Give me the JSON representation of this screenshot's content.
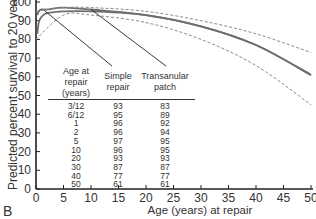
{
  "panel_label": "B",
  "chart_data": {
    "type": "line",
    "title": "",
    "xlabel": "Age (years) at repair",
    "ylabel": "Predicted percent survival to 20 years",
    "xlim": [
      0,
      50
    ],
    "ylim": [
      0,
      100
    ],
    "xticks": [
      "0",
      "5",
      "10",
      "15",
      "20",
      "25",
      "30",
      "35",
      "40",
      "45",
      "50"
    ],
    "yticks": [
      "0",
      "10",
      "20",
      "30",
      "40",
      "50",
      "60",
      "70",
      "80",
      "90",
      "100"
    ],
    "grid": false,
    "series": [
      {
        "name": "Simple repair",
        "style": "solid",
        "x": [
          0.25,
          0.5,
          1,
          2,
          5,
          10,
          20,
          30,
          40,
          50
        ],
        "values": [
          93,
          95,
          96,
          96,
          97,
          96,
          93,
          87,
          77,
          61
        ]
      },
      {
        "name": "Transanular patch",
        "style": "solid",
        "x": [
          0.25,
          0.5,
          1,
          2,
          5,
          10,
          20,
          30,
          40,
          50
        ],
        "values": [
          83,
          89,
          92,
          94,
          95,
          95,
          93,
          87,
          77,
          61
        ]
      },
      {
        "name": "Upper confidence limit",
        "style": "dashed",
        "x": [
          0,
          5,
          10,
          20,
          30,
          40,
          50
        ],
        "values": [
          95,
          97,
          97,
          95,
          90,
          83,
          73
        ]
      },
      {
        "name": "Lower confidence limit",
        "style": "dashed",
        "x": [
          0,
          5,
          10,
          20,
          30,
          40,
          50
        ],
        "values": [
          80,
          93,
          93,
          89,
          80,
          66,
          45
        ]
      }
    ],
    "annotations": [
      "Simple repair",
      "Transanular patch"
    ],
    "table": {
      "headers": [
        "Age at repair (years)",
        "Simple repair",
        "Transanular patch"
      ],
      "rows": [
        [
          "3/12",
          "93",
          "83"
        ],
        [
          "6/12",
          "95",
          "89"
        ],
        [
          "1",
          "96",
          "92"
        ],
        [
          "2",
          "96",
          "94"
        ],
        [
          "5",
          "97",
          "95"
        ],
        [
          "10",
          "96",
          "95"
        ],
        [
          "20",
          "93",
          "93"
        ],
        [
          "30",
          "87",
          "87"
        ],
        [
          "40",
          "77",
          "77"
        ],
        [
          "50",
          "61",
          "61"
        ]
      ]
    }
  },
  "table_headers": {
    "age": [
      "Age at",
      "repair",
      "(years)"
    ],
    "simple": [
      "Simple",
      "repair"
    ],
    "patch": [
      "Transanular",
      "patch"
    ]
  }
}
